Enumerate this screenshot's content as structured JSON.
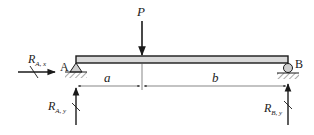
{
  "diagram": {
    "type": "simply-supported-beam",
    "load": {
      "label": "P",
      "direction": "down"
    },
    "supports": [
      {
        "name": "A",
        "kind": "pin"
      },
      {
        "name": "B",
        "kind": "roller"
      }
    ],
    "reactions": {
      "ax": {
        "R": "R",
        "sub": "A, x"
      },
      "ay": {
        "R": "R",
        "sub": "A, y"
      },
      "by": {
        "R": "R",
        "sub": "B, y"
      }
    },
    "dimensions": [
      {
        "label": "a"
      },
      {
        "label": "b"
      }
    ],
    "colors": {
      "line": "#1a1a1a",
      "beam_fill": "#d9d9d9",
      "hatch": "#555555",
      "roller_fill": "#cfcfcf"
    }
  }
}
